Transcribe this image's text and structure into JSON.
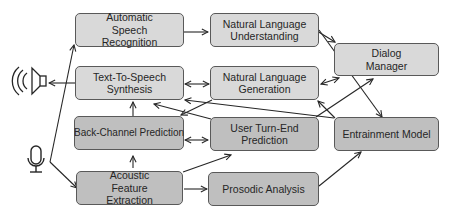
{
  "diagram": {
    "nodes": {
      "asr": {
        "label": "Automatic Speech Recognition"
      },
      "nlu": {
        "label": "Natural Language Understanding"
      },
      "dm": {
        "label": "Dialog Manager"
      },
      "tts": {
        "label": "Text-To-Speech Synthesis"
      },
      "nlg": {
        "label": "Natural Language Generation"
      },
      "bcp": {
        "label": "Back-Channel Prediction"
      },
      "ute": {
        "label": "User Turn-End Prediction"
      },
      "ent": {
        "label": "Entrainment Model"
      },
      "afe": {
        "label": "Acoustic Feature Extraction"
      },
      "pro": {
        "label": "Prosodic Analysis"
      }
    },
    "icons": {
      "speaker": "speaker-icon",
      "microphone": "microphone-icon"
    },
    "colors": {
      "light_box": "#d9d9d9",
      "dark_box": "#bfbfbf",
      "border": "#595959",
      "arrow": "#262626"
    },
    "edges": [
      {
        "from": "microphone",
        "to": "asr"
      },
      {
        "from": "microphone",
        "to": "afe"
      },
      {
        "from": "asr",
        "to": "nlu"
      },
      {
        "from": "nlu",
        "to": "dm"
      },
      {
        "from": "nlu",
        "to": "ent"
      },
      {
        "from": "tts",
        "to": "speaker"
      },
      {
        "from": "tts",
        "to": "nlg",
        "bidirectional": true
      },
      {
        "from": "nlg",
        "to": "dm",
        "bidirectional": true
      },
      {
        "from": "nlg",
        "to": "bcp"
      },
      {
        "from": "ute",
        "to": "nlg"
      },
      {
        "from": "ute",
        "to": "dm"
      },
      {
        "from": "ent",
        "to": "tts"
      },
      {
        "from": "ute",
        "to": "tts"
      },
      {
        "from": "bcp",
        "to": "tts"
      },
      {
        "from": "bcp",
        "to": "ute",
        "bidirectional": true
      },
      {
        "from": "afe",
        "to": "bcp"
      },
      {
        "from": "afe",
        "to": "ute"
      },
      {
        "from": "afe",
        "to": "pro"
      },
      {
        "from": "pro",
        "to": "ent"
      }
    ]
  }
}
